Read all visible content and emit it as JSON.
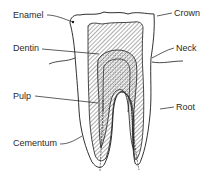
{
  "diagram": {
    "colors": {
      "line": "#1a1a1a",
      "text": "#2a2a2a",
      "background": "#ffffff"
    },
    "labels": {
      "enamel": "Enamel",
      "dentin": "Dentin",
      "pulp": "Pulp",
      "cementum": "Cementum",
      "crown": "Crown",
      "neck": "Neck",
      "root": "Root"
    }
  }
}
